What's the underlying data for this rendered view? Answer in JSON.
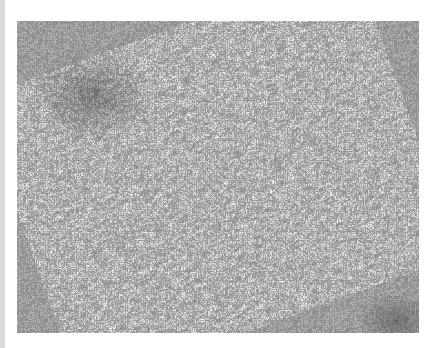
{
  "image": {
    "kind": "grayscale histology micrograph",
    "description": "Densely cellular spindle-cell tissue with scattered dark nuclei and a denser cluster in the upper left",
    "colors": {
      "background": "#ffffff",
      "left_strip": "#d9d9d9",
      "tissue_base": "#b4b4b4",
      "nuclei": "#3a3a3a",
      "stroma_light": "#d2d2d2"
    }
  }
}
